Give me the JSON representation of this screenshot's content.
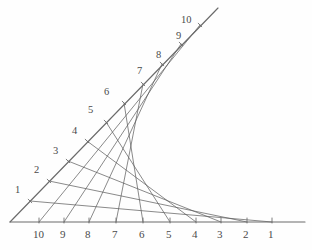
{
  "figure": {
    "background_color": "#fefefe",
    "line_color": "#5c5c5c",
    "axis_color": "#6b6b6b",
    "label_color": "#4a4a4a"
  },
  "chart_data": {
    "type": "line",
    "xlabel": "",
    "ylabel": "",
    "grid": false,
    "legend": false,
    "origin": {
      "x": 10,
      "y": 222
    },
    "axes": [
      {
        "name": "horizontal-axis",
        "from": {
          "x": 10,
          "y": 222
        },
        "to": {
          "x": 305,
          "y": 222
        },
        "tick_labels": [
          "10",
          "9",
          "8",
          "7",
          "6",
          "5",
          "4",
          "3",
          "2",
          "1"
        ],
        "tick_order": "descending-left-to-right"
      },
      {
        "name": "diagonal-axis",
        "from": {
          "x": 10,
          "y": 222
        },
        "to": {
          "x": 218,
          "y": 8
        },
        "tick_labels": [
          "1",
          "2",
          "3",
          "4",
          "5",
          "6",
          "7",
          "8",
          "9",
          "10"
        ],
        "tick_order": "ascending-bottom-to-top"
      }
    ],
    "nodes_bottom": [
      {
        "label": "10",
        "x": 39,
        "y": 222,
        "label_x": 33,
        "label_y": 229
      },
      {
        "label": "9",
        "x": 64,
        "y": 222,
        "label_x": 60,
        "label_y": 229
      },
      {
        "label": "8",
        "x": 89,
        "y": 222,
        "label_x": 85,
        "label_y": 229
      },
      {
        "label": "7",
        "x": 116,
        "y": 222,
        "label_x": 112,
        "label_y": 229
      },
      {
        "label": "6",
        "x": 143,
        "y": 222,
        "label_x": 139,
        "label_y": 229
      },
      {
        "label": "5",
        "x": 170,
        "y": 222,
        "label_x": 166,
        "label_y": 229
      },
      {
        "label": "4",
        "x": 196,
        "y": 222,
        "label_x": 192,
        "label_y": 229
      },
      {
        "label": "3",
        "x": 221,
        "y": 222,
        "label_x": 217,
        "label_y": 229
      },
      {
        "label": "2",
        "x": 247,
        "y": 222,
        "label_x": 243,
        "label_y": 229
      },
      {
        "label": "1",
        "x": 272,
        "y": 222,
        "label_x": 268,
        "label_y": 229
      }
    ],
    "nodes_diagonal": [
      {
        "label": "1",
        "x": 30,
        "y": 201,
        "label_x": 15,
        "label_y": 185
      },
      {
        "label": "2",
        "x": 49,
        "y": 181,
        "label_x": 34,
        "label_y": 165
      },
      {
        "label": "3",
        "x": 68,
        "y": 161,
        "label_x": 53,
        "label_y": 146
      },
      {
        "label": "4",
        "x": 87,
        "y": 141,
        "label_x": 72,
        "label_y": 126
      },
      {
        "label": "5",
        "x": 106,
        "y": 122,
        "label_x": 88,
        "label_y": 105
      },
      {
        "label": "6",
        "x": 124,
        "y": 103,
        "label_x": 104,
        "label_y": 87
      },
      {
        "label": "7",
        "x": 143,
        "y": 84,
        "label_x": 137,
        "label_y": 66
      },
      {
        "label": "8",
        "x": 162,
        "y": 64,
        "label_x": 156,
        "label_y": 50
      },
      {
        "label": "9",
        "x": 181,
        "y": 44,
        "label_x": 176,
        "label_y": 31
      },
      {
        "label": "10",
        "x": 200,
        "y": 25,
        "label_x": 181,
        "label_y": 15
      }
    ],
    "chords": [
      {
        "index": 1,
        "from_bottom": "1",
        "to_diagonal": "1"
      },
      {
        "index": 2,
        "from_bottom": "2",
        "to_diagonal": "2"
      },
      {
        "index": 3,
        "from_bottom": "3",
        "to_diagonal": "3"
      },
      {
        "index": 4,
        "from_bottom": "4",
        "to_diagonal": "4"
      },
      {
        "index": 5,
        "from_bottom": "5",
        "to_diagonal": "5"
      },
      {
        "index": 6,
        "from_bottom": "6",
        "to_diagonal": "6"
      },
      {
        "index": 7,
        "from_bottom": "7",
        "to_diagonal": "7"
      },
      {
        "index": 8,
        "from_bottom": "8",
        "to_diagonal": "8"
      },
      {
        "index": 9,
        "from_bottom": "9",
        "to_diagonal": "9"
      },
      {
        "index": 10,
        "from_bottom": "10",
        "to_diagonal": "10"
      }
    ]
  }
}
